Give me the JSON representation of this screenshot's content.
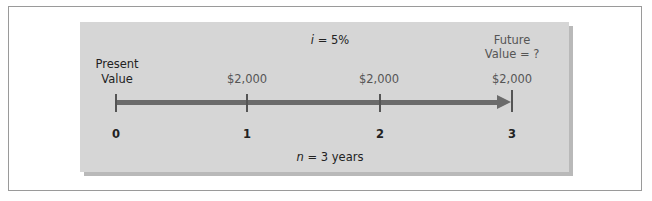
{
  "diagram": {
    "rate_var": "i",
    "rate_value": " = 5%",
    "periods_var": "n",
    "periods_value": " = 3 years",
    "present_value_label_line1": "Present",
    "present_value_label_line2": "Value",
    "future_value_label_line1": "Future",
    "future_value_label_line2": "Value = ?",
    "payments": [
      "$2,000",
      "$2,000",
      "$2,000"
    ],
    "ticks": [
      "0",
      "1",
      "2",
      "3"
    ],
    "colors": {
      "panel": "#d6d6d6",
      "panel_shadow": "#b9b9b9",
      "timeline": "#6b6b6b",
      "border": "#9a9a9a"
    }
  }
}
